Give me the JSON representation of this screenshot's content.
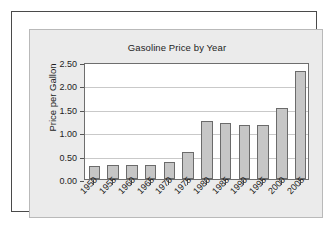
{
  "chart_data": {
    "type": "bar",
    "title": "Gasoline Price by Year",
    "xlabel": "",
    "ylabel": "Price per Gallon",
    "categories": [
      "1950",
      "1955",
      "1960",
      "1965",
      "1970",
      "1975",
      "1980",
      "1985",
      "1990",
      "1995",
      "2000",
      "2005"
    ],
    "values": [
      0.27,
      0.3,
      0.31,
      0.31,
      0.36,
      0.57,
      1.25,
      1.19,
      1.16,
      1.15,
      1.51,
      2.3
    ],
    "ylim": [
      0.0,
      2.5
    ],
    "ytick_labels": [
      "0.00",
      "0.50",
      "1.00",
      "1.50",
      "2.00",
      "2.50"
    ],
    "ytick_values": [
      0.0,
      0.5,
      1.0,
      1.5,
      2.0,
      2.5
    ],
    "grid": true,
    "legend": false,
    "bar_color": "#c6c6c6",
    "bar_edge_color": "#6b6b6b",
    "plot_background": "#ffffff",
    "panel_background": "#ebebeb",
    "frame_color": "#4a4a4a"
  }
}
